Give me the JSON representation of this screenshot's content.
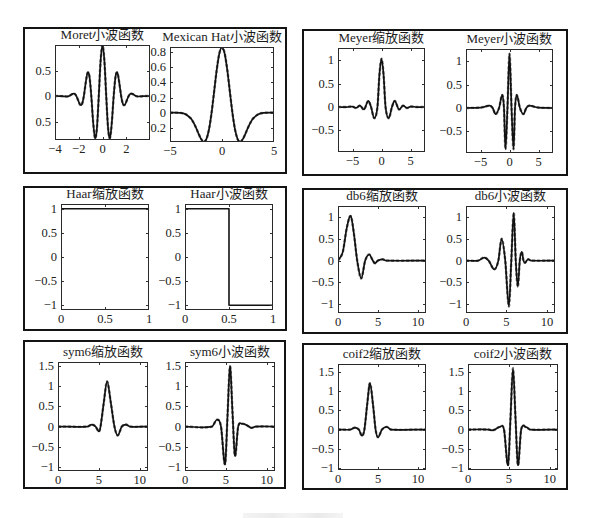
{
  "chart_data": [
    {
      "type": "line",
      "title": "Moret小波函数",
      "xlabel": "",
      "ylabel": "",
      "grid": false,
      "legend": null,
      "xlim": [
        -4,
        4
      ],
      "ylim": [
        -0.86,
        1.0
      ],
      "xticks": [
        -4,
        -2,
        0,
        2
      ],
      "xticklabels": [
        "−4",
        "−2",
        "0",
        "2"
      ],
      "yticks": [
        0.5,
        0,
        -0.5
      ],
      "yticklabels": [
        "0.5",
        "0",
        "0.5"
      ],
      "series": [
        {
          "interp": "smooth",
          "x": [
            -4,
            -3.5,
            -3.3,
            -3.142,
            -2.985,
            -2.827,
            -2.67,
            -2.513,
            -2.356,
            -2.199,
            -2.042,
            -1.885,
            -1.728,
            -1.571,
            -1.414,
            -1.257,
            -1.1,
            -0.942,
            -0.785,
            -0.628,
            -0.471,
            -0.314,
            -0.157,
            0,
            0.157,
            0.314,
            0.471,
            0.628,
            0.785,
            0.942,
            1.1,
            1.257,
            1.414,
            1.571,
            1.728,
            1.885,
            2.042,
            2.199,
            2.356,
            2.513,
            2.67,
            2.827,
            2.985,
            3.142,
            3.3,
            3.5,
            4
          ],
          "y": [
            0,
            0,
            -0.004,
            -0.007,
            -0.008,
            0,
            0.02,
            0.043,
            0.044,
            0,
            -0.088,
            -0.169,
            -0.159,
            0,
            0.26,
            0.454,
            0.386,
            0,
            -0.519,
            -0.821,
            -0.633,
            0,
            0.698,
            1,
            0.698,
            0,
            -0.633,
            -0.821,
            -0.519,
            0,
            0.386,
            0.454,
            0.26,
            0,
            -0.159,
            -0.169,
            -0.088,
            0,
            0.044,
            0.043,
            0.02,
            0,
            -0.008,
            -0.007,
            -0.004,
            0,
            0
          ]
        }
      ]
    },
    {
      "type": "line",
      "title": "Mexican Hat小波函数",
      "xlabel": "",
      "ylabel": "",
      "grid": false,
      "legend": null,
      "xlim": [
        -5,
        5
      ],
      "ylim": [
        -0.39,
        0.87
      ],
      "xticks": [
        -5,
        0,
        5
      ],
      "xticklabels": [
        "−5",
        "0",
        "5"
      ],
      "yticks": [
        0.8,
        0.6,
        0.4,
        0.2,
        0,
        -0.2
      ],
      "yticklabels": [
        "0.8",
        "0.6",
        "0.4",
        "0.2",
        "0",
        "0.2"
      ],
      "series": [
        {
          "interp": "smooth",
          "x": [
            -5,
            -4,
            -3.5,
            -3,
            -2.75,
            -2.5,
            -2.25,
            -2,
            -1.75,
            -1.5,
            -1.25,
            -1,
            -0.75,
            -0.5,
            -0.25,
            0,
            0.25,
            0.5,
            0.75,
            1,
            1.25,
            1.5,
            1.75,
            2,
            2.25,
            2.5,
            2.75,
            3,
            3.5,
            4,
            5
          ],
          "y": [
            0,
            -0.004,
            -0.021,
            -0.077,
            -0.13,
            -0.2,
            -0.281,
            -0.352,
            -0.387,
            -0.352,
            -0.223,
            0,
            0.286,
            0.574,
            0.788,
            0.867,
            0.788,
            0.574,
            0.286,
            0,
            -0.223,
            -0.352,
            -0.387,
            -0.352,
            -0.281,
            -0.2,
            -0.13,
            -0.077,
            -0.021,
            -0.004,
            0
          ]
        }
      ]
    },
    {
      "type": "line",
      "title": "Meyer缩放函数",
      "xlabel": "",
      "ylabel": "",
      "grid": false,
      "legend": null,
      "xlim": [
        -7.5,
        7.5
      ],
      "ylim": [
        -0.96,
        1.26
      ],
      "xticks": [
        -5,
        0,
        5
      ],
      "xticklabels": [
        "−5",
        "0",
        "5"
      ],
      "yticks": [
        1,
        0.5,
        0,
        -0.5
      ],
      "yticklabels": [
        "1",
        "0.5",
        "0",
        "−0.5"
      ],
      "series": [
        {
          "interp": "smooth",
          "x": [
            -7.5,
            -6,
            -5,
            -4.4,
            -3.7,
            -3,
            -2.3,
            -1.8,
            -1.25,
            -0.7,
            -0.35,
            0,
            0.35,
            0.7,
            1.25,
            1.8,
            2.3,
            3,
            3.7,
            4.4,
            5,
            6,
            7.5
          ],
          "y": [
            0,
            0,
            0.01,
            -0.02,
            0.03,
            -0.05,
            0.13,
            0,
            -0.24,
            0,
            0.7,
            1.03,
            0.7,
            0,
            -0.24,
            0,
            0.13,
            -0.05,
            0.03,
            -0.02,
            0.01,
            0,
            0
          ]
        }
      ]
    },
    {
      "type": "line",
      "title": "Meyer小波函数",
      "xlabel": "",
      "ylabel": "",
      "grid": false,
      "legend": null,
      "xlim": [
        -7.5,
        7.5
      ],
      "ylim": [
        -0.96,
        1.26
      ],
      "xticks": [
        -5,
        0,
        5
      ],
      "xticklabels": [
        "−5",
        "0",
        "5"
      ],
      "yticks": [
        1,
        0.5,
        0,
        -0.5
      ],
      "yticklabels": [
        "1",
        "0.5",
        "0",
        "−0.5"
      ],
      "series": [
        {
          "interp": "smooth",
          "x": [
            -7.5,
            -5,
            -4.2,
            -3.4,
            -2.9,
            -2.4,
            -1.8,
            -1.25,
            -0.95,
            -0.7,
            -0.35,
            0,
            0.35,
            0.7,
            0.95,
            1.25,
            1.8,
            2.4,
            2.9,
            3.4,
            4.2,
            5,
            7.5
          ],
          "y": [
            0,
            0.01,
            0.03,
            0.05,
            0,
            -0.13,
            0,
            0.28,
            0,
            -0.88,
            0,
            1.16,
            0,
            -0.88,
            0,
            0.28,
            0,
            -0.13,
            0,
            0.05,
            0.03,
            0.01,
            0
          ]
        }
      ]
    },
    {
      "type": "line",
      "title": "Haar缩放函数",
      "xlabel": "",
      "ylabel": "",
      "grid": false,
      "legend": null,
      "xlim": [
        0,
        1
      ],
      "ylim": [
        -1.1,
        1.1
      ],
      "xticks": [
        0,
        0.5,
        1
      ],
      "xticklabels": [
        "0",
        "0.5",
        "1"
      ],
      "yticks": [
        1,
        0.5,
        0,
        -0.5,
        -1
      ],
      "yticklabels": [
        "1",
        "0.5",
        "0",
        "−0.5",
        "−1"
      ],
      "series": [
        {
          "interp": "linear",
          "x": [
            0,
            0,
            1,
            1
          ],
          "y": [
            0,
            1,
            1,
            0
          ]
        }
      ]
    },
    {
      "type": "line",
      "title": "Haar小波函数",
      "xlabel": "",
      "ylabel": "",
      "grid": false,
      "legend": null,
      "xlim": [
        0,
        1
      ],
      "ylim": [
        -1.1,
        1.1
      ],
      "xticks": [
        0,
        0.5,
        1
      ],
      "xticklabels": [
        "0",
        "0.5",
        "1"
      ],
      "yticks": [
        1,
        0.5,
        0,
        -0.5,
        -1
      ],
      "yticklabels": [
        "1",
        "0.5",
        "0",
        "−0.5",
        "−1"
      ],
      "series": [
        {
          "interp": "linear",
          "x": [
            0,
            0,
            0.5,
            0.5,
            1,
            1
          ],
          "y": [
            0.25,
            1,
            1,
            -1,
            -1,
            0
          ]
        }
      ]
    },
    {
      "type": "line",
      "title": "db6缩放函数",
      "xlabel": "",
      "ylabel": "",
      "grid": false,
      "legend": null,
      "xlim": [
        0,
        11
      ],
      "ylim": [
        -1.2,
        1.25
      ],
      "xticks": [
        0,
        5,
        10
      ],
      "xticklabels": [
        "0",
        "5",
        "10"
      ],
      "yticks": [
        1,
        0.5,
        0,
        -0.5,
        -1
      ],
      "yticklabels": [
        "1",
        "0.5",
        "0",
        "−0.5",
        "−1"
      ],
      "series": [
        {
          "interp": "smooth",
          "x": [
            0,
            0.6,
            1.1,
            1.6,
            2.0,
            2.4,
            2.9,
            3.4,
            3.9,
            4.3,
            4.6,
            5.0,
            5.6,
            6.0,
            11
          ],
          "y": [
            0,
            0.2,
            0.75,
            1.02,
            0.6,
            0,
            -0.41,
            0,
            0.14,
            0.02,
            -0.06,
            0,
            0.03,
            0,
            0
          ]
        }
      ]
    },
    {
      "type": "line",
      "title": "db6小波函数",
      "xlabel": "",
      "ylabel": "",
      "grid": false,
      "legend": null,
      "xlim": [
        0,
        11
      ],
      "ylim": [
        -1.2,
        1.25
      ],
      "xticks": [
        0,
        5,
        10
      ],
      "xticklabels": [
        "0",
        "5",
        "10"
      ],
      "yticks": [
        1,
        0.5,
        0,
        -0.5,
        -1
      ],
      "yticklabels": [
        "1",
        "0.5",
        "0",
        "−0.5",
        "−1"
      ],
      "series": [
        {
          "interp": "smooth",
          "x": [
            0,
            1.5,
            2.25,
            2.8,
            3.5,
            4.0,
            4.4,
            4.85,
            5.3,
            5.6,
            5.9,
            6.15,
            6.4,
            6.65,
            6.9,
            7.1,
            7.3,
            7.5,
            7.7,
            8.0,
            11
          ],
          "y": [
            0,
            0,
            0.07,
            0,
            -0.2,
            0,
            0.5,
            0,
            -1.05,
            0,
            1.1,
            0,
            -0.6,
            0,
            0.2,
            0,
            -0.05,
            0,
            0.03,
            0,
            0
          ]
        }
      ]
    },
    {
      "type": "line",
      "title": "sym6缩放函数",
      "xlabel": "",
      "ylabel": "",
      "grid": false,
      "legend": null,
      "xlim": [
        0,
        11
      ],
      "ylim": [
        -1.1,
        1.6
      ],
      "xticks": [
        0,
        5,
        10
      ],
      "xticklabels": [
        "0",
        "5",
        "10"
      ],
      "yticks": [
        1.5,
        1,
        0.5,
        0,
        -0.5,
        -1
      ],
      "yticklabels": [
        "1.5",
        "1",
        "0.5",
        "0",
        "−0.5",
        "−1"
      ],
      "series": [
        {
          "interp": "smooth",
          "x": [
            0,
            3.6,
            4.15,
            4.6,
            5.0,
            5.2,
            5.6,
            6.0,
            6.45,
            6.9,
            7.3,
            7.8,
            8.3,
            8.8,
            11
          ],
          "y": [
            0,
            0,
            0.05,
            0,
            -0.12,
            0,
            0.6,
            1.12,
            0.6,
            0,
            -0.22,
            0,
            0.05,
            0,
            0
          ]
        }
      ]
    },
    {
      "type": "line",
      "title": "sym6小波函数",
      "xlabel": "",
      "ylabel": "",
      "grid": false,
      "legend": null,
      "xlim": [
        0,
        11
      ],
      "ylim": [
        -1.1,
        1.6
      ],
      "xticks": [
        0,
        5,
        10
      ],
      "xticklabels": [
        "0",
        "5",
        "10"
      ],
      "yticks": [
        1.5,
        1,
        0.5,
        0,
        -0.5,
        -1
      ],
      "yticklabels": [
        "1.5",
        "1",
        "0.5",
        "0",
        "−0.5",
        "−1"
      ],
      "series": [
        {
          "interp": "smooth",
          "x": [
            0,
            3.3,
            3.9,
            4.4,
            4.9,
            5.2,
            5.5,
            5.8,
            6.1,
            6.5,
            7.0,
            7.5,
            8.1,
            8.6,
            11
          ],
          "y": [
            0,
            0,
            0.17,
            0,
            -0.93,
            0.28,
            1.49,
            0.38,
            -0.72,
            0,
            0.07,
            0.04,
            -0.03,
            0,
            0
          ]
        }
      ]
    },
    {
      "type": "line",
      "title": "coif2缩放函数",
      "xlabel": "",
      "ylabel": "",
      "grid": false,
      "legend": null,
      "xlim": [
        0,
        11
      ],
      "ylim": [
        -1.05,
        1.7
      ],
      "xticks": [
        0,
        5,
        10
      ],
      "xticklabels": [
        "0",
        "5",
        "10"
      ],
      "yticks": [
        1.5,
        1,
        0.5,
        0,
        -0.5,
        -1
      ],
      "yticklabels": [
        "1.5",
        "1",
        "0.5",
        "0",
        "−0.5",
        "−1"
      ],
      "series": [
        {
          "interp": "smooth",
          "x": [
            0,
            1.6,
            2.1,
            2.6,
            3.0,
            3.3,
            3.65,
            4.0,
            4.4,
            4.7,
            5.0,
            5.5,
            6.1,
            6.6,
            11
          ],
          "y": [
            0,
            0,
            0.05,
            0,
            -0.16,
            0,
            0.65,
            1.2,
            0.6,
            0,
            -0.2,
            0,
            0.07,
            0,
            0
          ]
        }
      ]
    },
    {
      "type": "line",
      "title": "coif2小波函数",
      "xlabel": "",
      "ylabel": "",
      "grid": false,
      "legend": null,
      "xlim": [
        0,
        11
      ],
      "ylim": [
        -1.05,
        1.7
      ],
      "xticks": [
        0,
        5,
        10
      ],
      "xticklabels": [
        "0",
        "5",
        "10"
      ],
      "yticks": [
        1.5,
        1,
        0.5,
        0,
        -0.5,
        -1
      ],
      "yticklabels": [
        "1.5",
        "1",
        "0.5",
        "0",
        "−0.5",
        "−1"
      ],
      "series": [
        {
          "interp": "smooth",
          "x": [
            0,
            2.5,
            2.9,
            3.3,
            3.9,
            4.4,
            4.9,
            5.2,
            5.5,
            5.8,
            6.1,
            6.5,
            7.1,
            7.6,
            11
          ],
          "y": [
            0,
            0,
            -0.02,
            0,
            0.07,
            0,
            -0.92,
            0.33,
            1.59,
            0.33,
            -0.92,
            0,
            0.06,
            0,
            0
          ]
        }
      ]
    }
  ]
}
